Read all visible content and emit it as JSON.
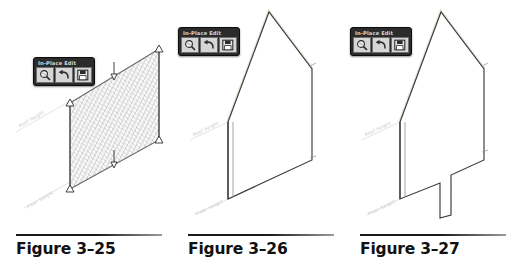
{
  "page": {
    "background_color": "#ffffff",
    "figure_count": 3
  },
  "toolbar": {
    "title": "In-Place Edit",
    "title_color": "#d8d8d8",
    "bar_color": "#2b2b2b",
    "button_face_color": "#d6d6d6",
    "buttons": [
      {
        "name": "zoom-magnifier",
        "tooltip": "Edit Profile"
      },
      {
        "name": "undo-arrow",
        "tooltip": "Cancel"
      },
      {
        "name": "save-disk",
        "tooltip": "Finish Sketch"
      }
    ]
  },
  "figures": [
    {
      "id": "figure-3-25",
      "caption": "Figure 3–25",
      "description": "Isometric wall panel shown with fine diagonal mesh hatch and drag grips at corners and mid-edges",
      "has_hatch": true,
      "has_grips": true,
      "grip_count": 6,
      "labels": [
        {
          "name": "roof-height-label",
          "text": "Roof height"
        },
        {
          "name": "floor-height-label",
          "text": "Floor height"
        }
      ]
    },
    {
      "id": "figure-3-26",
      "caption": "Figure 3–26",
      "description": "Isometric gable wall outline in sketch-edit mode with straight bottom edge",
      "has_hatch": false,
      "has_grips": false,
      "has_notch": false,
      "labels": [
        {
          "name": "roof-height-label",
          "text": "Roof height"
        },
        {
          "name": "floor-height-label",
          "text": "Floor height"
        }
      ]
    },
    {
      "id": "figure-3-27",
      "caption": "Figure 3–27",
      "description": "Isometric gable wall outline with a rectangular notch cut into the bottom edge",
      "has_hatch": false,
      "has_grips": false,
      "has_notch": true,
      "labels": [
        {
          "name": "roof-height-label",
          "text": "Roof height"
        },
        {
          "name": "floor-height-label",
          "text": "Floor height"
        }
      ]
    }
  ],
  "colors": {
    "outline": "#3a3a3a",
    "hatch": "#9a9a9a",
    "dim_line": "#d0d0d0",
    "caption_text": "#111111",
    "rule_dark": "#1a1a1a",
    "rule_light": "#9b9b9b"
  }
}
